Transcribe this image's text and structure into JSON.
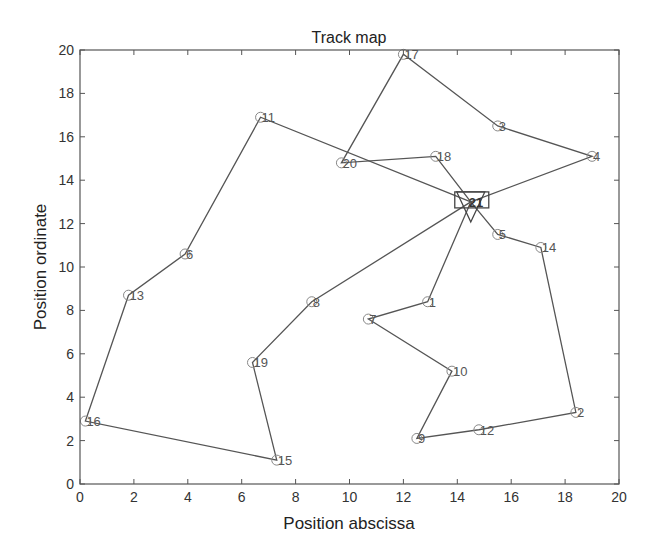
{
  "chart_data": {
    "type": "scatter",
    "title": "Track map",
    "xlabel": "Position abscissa",
    "ylabel": "Position ordinate",
    "xlim": [
      0,
      20
    ],
    "ylim": [
      0,
      20
    ],
    "xticks": [
      0,
      2,
      4,
      6,
      8,
      10,
      12,
      14,
      16,
      18,
      20
    ],
    "yticks": [
      0,
      2,
      4,
      6,
      8,
      10,
      12,
      14,
      16,
      18,
      20
    ],
    "grid": false,
    "legend": null,
    "depot": {
      "id": 21,
      "x": 14.5,
      "y": 13.0,
      "marker": "triangle-in-square"
    },
    "points": [
      {
        "id": 1,
        "x": 12.9,
        "y": 8.4
      },
      {
        "id": 2,
        "x": 18.4,
        "y": 3.3
      },
      {
        "id": 3,
        "x": 15.5,
        "y": 16.5
      },
      {
        "id": 4,
        "x": 19.0,
        "y": 15.1
      },
      {
        "id": 5,
        "x": 15.5,
        "y": 11.5
      },
      {
        "id": 6,
        "x": 3.9,
        "y": 10.6
      },
      {
        "id": 7,
        "x": 10.7,
        "y": 7.6
      },
      {
        "id": 8,
        "x": 8.6,
        "y": 8.4
      },
      {
        "id": 9,
        "x": 12.5,
        "y": 2.1
      },
      {
        "id": 10,
        "x": 13.8,
        "y": 5.2
      },
      {
        "id": 11,
        "x": 6.7,
        "y": 16.9
      },
      {
        "id": 12,
        "x": 14.8,
        "y": 2.5
      },
      {
        "id": 13,
        "x": 1.8,
        "y": 8.7
      },
      {
        "id": 14,
        "x": 17.1,
        "y": 10.9
      },
      {
        "id": 15,
        "x": 7.3,
        "y": 1.1
      },
      {
        "id": 16,
        "x": 0.2,
        "y": 2.9
      },
      {
        "id": 17,
        "x": 12.0,
        "y": 19.8
      },
      {
        "id": 18,
        "x": 13.2,
        "y": 15.1
      },
      {
        "id": 19,
        "x": 6.4,
        "y": 5.6
      },
      {
        "id": 20,
        "x": 9.7,
        "y": 14.8
      },
      {
        "id": 21,
        "x": 14.5,
        "y": 13.0
      }
    ],
    "routes": [
      [
        21,
        18,
        20,
        17,
        3,
        4,
        21
      ],
      [
        21,
        11,
        6,
        13,
        16,
        15,
        19,
        8,
        21
      ],
      [
        21,
        1,
        7,
        10,
        9,
        12,
        2,
        14,
        5,
        21
      ]
    ],
    "colors": {
      "line": "#555555",
      "marker": "#888888",
      "axis": "#555555"
    }
  }
}
